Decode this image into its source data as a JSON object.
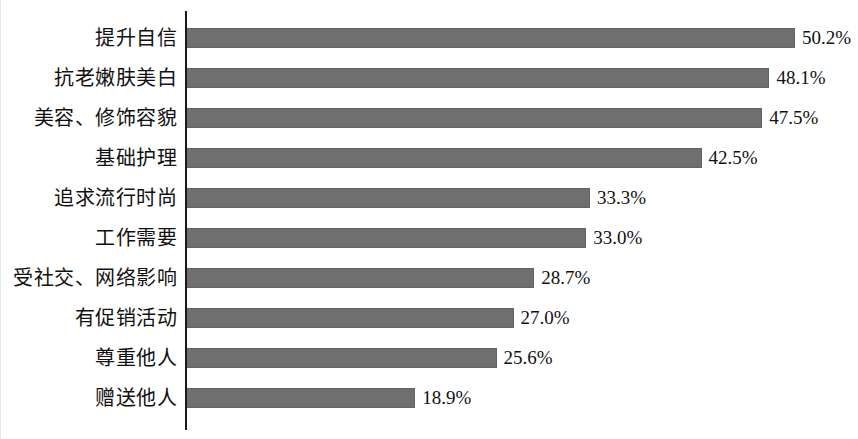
{
  "chart_data": {
    "type": "bar",
    "orientation": "horizontal",
    "title": "",
    "subtitle": "",
    "xlabel": "",
    "ylabel": "",
    "grid": false,
    "legend": false,
    "legend_position": "none",
    "axis_line_color": "#1a1a1a",
    "bar_color": "#6f6f6f",
    "xlim": [
      0,
      55
    ],
    "value_suffix": "%",
    "categories": [
      "提升自信",
      "抗老嫩肤美白",
      "美容、修饰容貌",
      "基础护理",
      "追求流行时尚",
      "工作需要",
      "受社交、网络影响",
      "有促销活动",
      "尊重他人",
      "赠送他人"
    ],
    "values": [
      50.2,
      48.1,
      47.5,
      42.5,
      33.3,
      33.0,
      28.7,
      27.0,
      25.6,
      18.9
    ],
    "value_labels": [
      "50.2%",
      "48.1%",
      "47.5%",
      "42.5%",
      "33.3%",
      "33.0%",
      "28.7%",
      "27.0%",
      "25.6%",
      "18.9%"
    ]
  }
}
